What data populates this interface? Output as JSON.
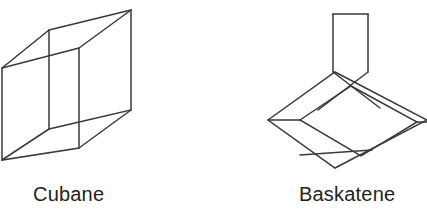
{
  "figure": {
    "background_color": "#ffffff",
    "line_color": "#3a3a3a",
    "text_color": "#222222",
    "type": "chemical-structure-line-diagram",
    "structures": [
      {
        "id": "cubane",
        "caption": "Cubane",
        "shape": "cube-wireframe-perspective",
        "note": "Left cube is cropped at the left edge of the image"
      },
      {
        "id": "baskatene",
        "caption": "Baskatene",
        "shape": "basket-like-fused-ring-wireframe",
        "note": "Right structure is cropped at the right edge of the image"
      }
    ]
  },
  "captions": {
    "cubane": "Cubane",
    "baskatene": "Baskatene"
  },
  "geometry": {
    "cubane": {
      "front_face": [
        [
          49,
          30
        ],
        [
          131,
          10
        ],
        [
          131,
          110
        ],
        [
          49,
          129
        ]
      ],
      "back_face": [
        [
          2,
          68
        ],
        [
          79,
          48
        ],
        [
          79,
          148
        ],
        [
          2,
          160
        ]
      ],
      "connectors": [
        [
          [
            2,
            68
          ],
          [
            49,
            30
          ]
        ],
        [
          [
            79,
            48
          ],
          [
            131,
            10
          ]
        ],
        [
          [
            2,
            160
          ],
          [
            49,
            129
          ]
        ],
        [
          [
            79,
            148
          ],
          [
            131,
            110
          ]
        ]
      ]
    },
    "baskatene": {
      "stem_rect": [
        [
          333,
          14
        ],
        [
          368,
          14
        ],
        [
          368,
          72
        ],
        [
          333,
          72
        ]
      ],
      "outer_diamond": [
        [
          268,
          120
        ],
        [
          335,
          72
        ],
        [
          427,
          120
        ],
        [
          335,
          168
        ]
      ],
      "inner_diamond": [
        [
          300,
          120
        ],
        [
          351,
          86
        ],
        [
          417,
          122
        ],
        [
          361,
          156
        ]
      ],
      "cross_lines": [
        [
          [
            333,
            72
          ],
          [
            380,
            108
          ]
        ],
        [
          [
            368,
            72
          ],
          [
            318,
            110
          ]
        ],
        [
          [
            300,
            155
          ],
          [
            372,
            150
          ]
        ]
      ]
    }
  }
}
